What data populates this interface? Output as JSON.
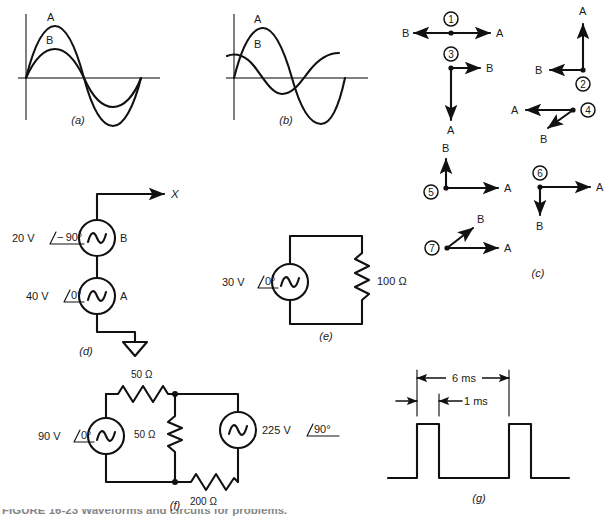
{
  "figure": {
    "caption_partial": "FIGURE 16-23    Waveforms and circuits for problems.",
    "panel_labels": {
      "a": "(a)",
      "b": "(b)",
      "c": "(c)",
      "d": "(d)",
      "e": "(e)",
      "f": "(f)",
      "g": "(g)"
    }
  },
  "panel_a": {
    "curve_a_label": "A",
    "curve_b_label": "B",
    "description": "Two in-phase sine waves, A larger amplitude than B"
  },
  "panel_b": {
    "curve_a_label": "A",
    "curve_b_label": "B",
    "description": "Sine wave A starting at zero; B leads A, starting near positive peak"
  },
  "panel_c": {
    "phasors": [
      {
        "number": "1",
        "a_label": "A",
        "b_label": "B",
        "a_dir": "right",
        "b_dir": "left"
      },
      {
        "number": "2",
        "a_label": "A",
        "b_label": "B",
        "a_dir": "up",
        "b_dir": "left"
      },
      {
        "number": "3",
        "a_label": "A",
        "b_label": "B",
        "a_dir": "down",
        "b_dir": "right"
      },
      {
        "number": "4",
        "a_label": "A",
        "b_label": "B",
        "a_dir": "left",
        "b_dir": "down-left"
      },
      {
        "number": "5",
        "a_label": "A",
        "b_label": "B",
        "a_dir": "right",
        "b_dir": "up"
      },
      {
        "number": "6",
        "a_label": "A",
        "b_label": "B",
        "a_dir": "right",
        "b_dir": "down"
      },
      {
        "number": "7",
        "a_label": "A",
        "b_label": "B",
        "a_dir": "right",
        "b_dir": "up-right"
      }
    ]
  },
  "panel_d": {
    "axis_label": "X",
    "source_b": {
      "magnitude": "20 V",
      "angle": "− 90°",
      "name": "B"
    },
    "source_a": {
      "magnitude": "40 V",
      "angle": "0°",
      "name": "A"
    },
    "ground": "ground-symbol"
  },
  "panel_e": {
    "source": {
      "magnitude": "30 V",
      "angle": "0°"
    },
    "resistor": "100 Ω"
  },
  "panel_f": {
    "source_left": {
      "magnitude": "90 V",
      "angle": "0°"
    },
    "source_right": {
      "magnitude": "225 V",
      "angle": "90°"
    },
    "resistor_top": "50 Ω",
    "resistor_middle": "50 Ω",
    "resistor_bottom": "200 Ω"
  },
  "panel_g": {
    "period_label": "6 ms",
    "pulse_width_label": "1 ms",
    "description": "Rectangular pulse train"
  }
}
